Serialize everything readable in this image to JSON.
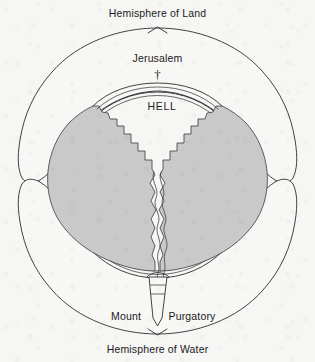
{
  "figure": {
    "background_color": "#f6f6f4",
    "ink_color": "#2e2e2e",
    "mass_fill_color": "#c9c9c9"
  },
  "labels": {
    "top": "Hemisphere of Land",
    "bottom": "Hemisphere of Water",
    "jerusalem": "Jerusalem",
    "hell": "HELL",
    "purgatory_left": "Mount",
    "purgatory_right": "Purgatory"
  },
  "icons": {
    "cross": "†"
  },
  "regions": [
    {
      "name": "hemisphere-of-land",
      "kind": "outer-lobe",
      "position": "top"
    },
    {
      "name": "hemisphere-of-water",
      "kind": "outer-lobe",
      "position": "bottom"
    },
    {
      "name": "earth-sphere",
      "kind": "circle",
      "position": "center"
    },
    {
      "name": "hell-cavity",
      "kind": "funnel",
      "position": "center"
    },
    {
      "name": "mount-purgatory",
      "kind": "cone",
      "position": "bottom-center"
    }
  ]
}
